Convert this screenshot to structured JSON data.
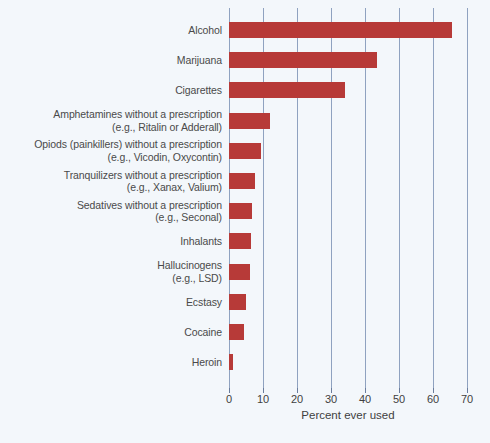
{
  "chart_data": {
    "type": "bar",
    "orientation": "horizontal",
    "title": "",
    "subtitle": "",
    "xlabel": "Percent ever used",
    "ylabel": "",
    "xlim": [
      0,
      70
    ],
    "xticks": [
      0,
      10,
      20,
      30,
      40,
      50,
      60,
      70
    ],
    "xtick_labels": [
      "0",
      "10",
      "20",
      "30",
      "40",
      "50",
      "60",
      "70"
    ],
    "grid": "vertical",
    "legend": "none",
    "bar_color": "#b73a38",
    "gridline_color": "#8fa2c0",
    "background_color": "#f3f7fb",
    "categories": [
      "Alcohol",
      "Marijuana",
      "Cigarettes",
      "Amphetamines without a prescription\n(e.g., Ritalin or Adderall)",
      "Opiods (painkillers) without a prescription\n(e.g., Vicodin, Oxycontin)",
      "Tranquilizers without a prescription\n(e.g., Xanax, Valium)",
      "Sedatives without a prescription\n(e.g., Seconal)",
      "Inhalants",
      "Hallucinogens\n(e.g., LSD)",
      "Ecstasy",
      "Cocaine",
      "Heroin"
    ],
    "category_lines": [
      [
        "Alcohol"
      ],
      [
        "Marijuana"
      ],
      [
        "Cigarettes"
      ],
      [
        "Amphetamines without a prescription",
        "(e.g., Ritalin or Adderall)"
      ],
      [
        "Opiods (painkillers) without a prescription",
        "(e.g., Vicodin, Oxycontin)"
      ],
      [
        "Tranquilizers without a prescription",
        "(e.g., Xanax, Valium)"
      ],
      [
        "Sedatives without a prescription",
        "(e.g., Seconal)"
      ],
      [
        "Inhalants"
      ],
      [
        "Hallucinogens",
        "(e.g., LSD)"
      ],
      [
        "Ecstasy"
      ],
      [
        "Cocaine"
      ],
      [
        "Heroin"
      ]
    ],
    "values": [
      65.5,
      43.5,
      34.0,
      12.2,
      9.5,
      7.7,
      6.8,
      6.4,
      6.1,
      5.0,
      4.3,
      1.1
    ]
  }
}
